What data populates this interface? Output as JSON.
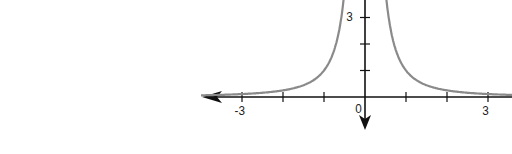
{
  "chart_data": {
    "type": "line",
    "title": "",
    "function": "y = 1/x^2",
    "xlabel": "",
    "ylabel": "",
    "x_ticks": [
      -3,
      -2,
      -1,
      1,
      2,
      3
    ],
    "y_ticks": [
      1,
      2,
      3
    ],
    "labeled_x_ticks": [
      "-3",
      "0",
      "3"
    ],
    "labeled_y_ticks": [
      "3"
    ],
    "xlim": [
      -3.9,
      3.5
    ],
    "ylim": [
      -0.6,
      4.2
    ],
    "grid": false,
    "series": [
      {
        "name": "1/x^2 (left branch)",
        "x": [
          -3.5,
          -3,
          -2.5,
          -2,
          -1.5,
          -1,
          -0.8,
          -0.6,
          -0.5
        ],
        "y": [
          0.08,
          0.11,
          0.16,
          0.25,
          0.44,
          1,
          1.56,
          2.78,
          4
        ]
      },
      {
        "name": "1/x^2 (right branch)",
        "x": [
          0.5,
          0.6,
          0.8,
          1,
          1.5,
          2,
          2.5,
          3,
          3.5
        ],
        "y": [
          4,
          2.78,
          1.56,
          1,
          0.44,
          0.25,
          0.16,
          0.11,
          0.08
        ]
      }
    ],
    "colors": {
      "curve": "#8a8a8a",
      "axes": "#111111"
    }
  },
  "labels": {
    "x_neg3": "-3",
    "origin": "0",
    "x_pos3": "3",
    "y_3": "3"
  }
}
